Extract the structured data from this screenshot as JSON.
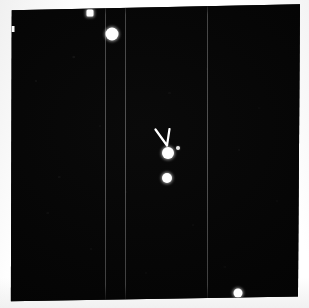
{
  "figure": {
    "caption": "Dark astronomical plate scan with bright point sources and a chevron marker",
    "width": 309,
    "height": 308
  },
  "colors": {
    "paper": "#ffffff",
    "plate_background": "#040404",
    "emulsion_tone": "#0a0a0a",
    "source_white": "#ffffff",
    "faint_source": "#e9e9e9",
    "seam_line": "#787878",
    "marker": "#ffffff"
  },
  "plate": {
    "name": "photographic-plate",
    "left": 10,
    "top": 3,
    "width": 290,
    "height": 300
  },
  "seams": [
    {
      "label": "scan-seam-1",
      "x_pct": 32.8
    },
    {
      "label": "scan-seam-2",
      "x_pct": 39.7
    },
    {
      "label": "scan-seam-3",
      "x_pct": 68.0
    }
  ],
  "sources": [
    {
      "id": "source-upper-small",
      "label": "upper small source",
      "x_pct": 27.6,
      "y_pct": 3.4,
      "size": 7,
      "shape": "boxy",
      "brightness": "bright"
    },
    {
      "id": "source-upper-bright",
      "label": "upper bright source",
      "x_pct": 35.2,
      "y_pct": 10.2,
      "size": 13,
      "shape": "round",
      "brightness": "bright"
    },
    {
      "id": "source-primary",
      "label": "marked primary source",
      "x_pct": 54.4,
      "y_pct": 50.0,
      "size": 12,
      "shape": "round",
      "brightness": "bright"
    },
    {
      "id": "source-secondary",
      "label": "companion source below primary",
      "x_pct": 54.2,
      "y_pct": 58.2,
      "size": 10,
      "shape": "round",
      "brightness": "bright"
    },
    {
      "id": "source-faint-right",
      "label": "faint source right of primary",
      "x_pct": 58.0,
      "y_pct": 48.2,
      "size": 4,
      "shape": "round",
      "brightness": "faint"
    },
    {
      "id": "source-lower-right",
      "label": "lower right source at plate edge",
      "x_pct": 78.6,
      "y_pct": 96.6,
      "size": 9,
      "shape": "round",
      "brightness": "bright"
    }
  ],
  "marker": {
    "id": "chevron-marker",
    "label": "V-shaped chevron pointing at primary source",
    "x_pct": 53.5,
    "y_pct": 45.8,
    "width": 22,
    "height": 20,
    "stroke_width": 2.2
  },
  "edge_features": [
    {
      "id": "left-edge-notch",
      "label": "white notch on left plate edge",
      "x_pct": 0.8,
      "y_pct": 8.6,
      "width": 5,
      "height": 6
    }
  ]
}
